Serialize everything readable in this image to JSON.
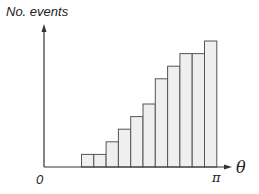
{
  "chart_data": {
    "type": "bar",
    "title": "",
    "xlabel": "θ",
    "ylabel": "No. events",
    "x_ticks": [
      "0",
      "π"
    ],
    "xlim": [
      0,
      3.14159
    ],
    "categories": [
      "b1",
      "b2",
      "b3",
      "b4",
      "b5",
      "b6",
      "b7",
      "b8",
      "b9",
      "b10",
      "b11"
    ],
    "values": [
      1,
      1,
      2,
      3,
      4,
      5,
      7,
      8,
      9,
      9,
      10
    ],
    "grid": false,
    "legend": null,
    "bar_fill": "#efefef",
    "bar_edge": "#555555"
  },
  "labels": {
    "ylabel": "No. events",
    "origin": "0",
    "pi": "π",
    "theta": "θ"
  }
}
